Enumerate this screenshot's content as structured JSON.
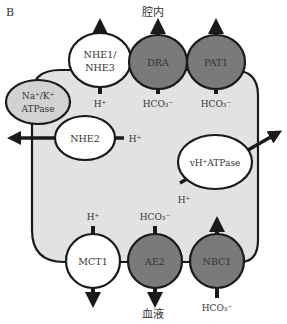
{
  "panel_label": "B",
  "regions": {
    "lumen": "腔内",
    "blood": "血液"
  },
  "colors": {
    "cell_fill": "#e2e2e2",
    "outline": "#1a1a1a",
    "white_transporter": "#ffffff",
    "dark_transporter": "#7a7a7a",
    "light_transporter": "#d2d2d2",
    "text": "#333333"
  },
  "transporters": {
    "nhe13": {
      "line1": "NHE1/",
      "line2": "NHE3",
      "ion": "H⁺"
    },
    "dra": {
      "label": "DRA",
      "ion": "HCO₃⁻"
    },
    "pat1": {
      "label": "PAT1",
      "ion": "HCO₃⁻"
    },
    "nak": {
      "line1": "Na⁺/K⁺",
      "line2": "ATPase"
    },
    "nhe2": {
      "label": "NHE2",
      "ion": "H⁺"
    },
    "vh": {
      "label": "vH⁺ATPase",
      "ion": "H⁺"
    },
    "mct1": {
      "label": "MCT1",
      "ion": "H⁺"
    },
    "ae2": {
      "label": "AE2",
      "ion": "HCO₃⁻"
    },
    "nbc1": {
      "label": "NBC1",
      "ion": "HCO₃⁻"
    }
  }
}
